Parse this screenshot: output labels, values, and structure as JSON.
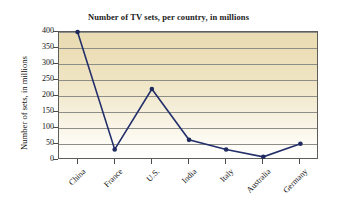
{
  "chart_data": {
    "type": "line",
    "title": "Number of TV sets, per country, in millions",
    "xlabel": "",
    "ylabel": "Number of sets, in millions",
    "categories": [
      "China",
      "France",
      "U.S.",
      "India",
      "Italy",
      "Australia",
      "Germany"
    ],
    "values": [
      400,
      33,
      222,
      63,
      33,
      10,
      51
    ],
    "series": [
      {
        "name": "Number of TV sets",
        "values": [
          400,
          33,
          222,
          63,
          33,
          10,
          51
        ]
      }
    ],
    "ylim": [
      0,
      400
    ],
    "yticks": [
      0,
      50,
      100,
      150,
      200,
      250,
      300,
      350,
      400
    ],
    "ytick_labels": [
      "0",
      "50",
      "100",
      "150",
      "200",
      "250",
      "300",
      "350",
      "400"
    ],
    "grid": true,
    "grid_axis": "y",
    "legend": "none",
    "marker": "circle",
    "line_color": "#24306b",
    "marker_color": "#1f2a5e",
    "plot_background_top": "#e9dcb2",
    "plot_background_bottom": "#ffffff",
    "gridline_color": "#8d8e88",
    "axis_color": "#5d5e5a"
  }
}
